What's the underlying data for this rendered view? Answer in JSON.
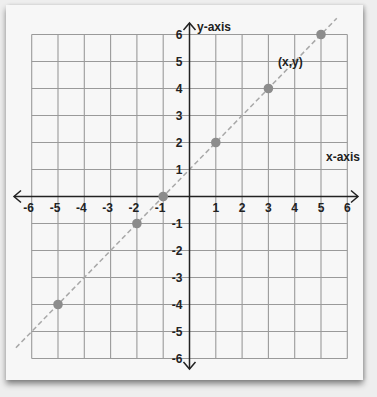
{
  "chart_data": {
    "type": "scatter",
    "title": "",
    "xlabel": "x-axis",
    "ylabel": "y-axis",
    "xlim": [
      -6,
      6
    ],
    "ylim": [
      -6,
      6
    ],
    "grid": true,
    "x_ticks": [
      -6,
      -5,
      -4,
      -3,
      -2,
      -1,
      1,
      2,
      3,
      4,
      5,
      6
    ],
    "y_ticks": [
      6,
      5,
      4,
      3,
      2,
      1,
      -1,
      -2,
      -3,
      -4,
      -5,
      -6
    ],
    "series": [
      {
        "name": "points",
        "points": [
          {
            "x": -5,
            "y": -4
          },
          {
            "x": -2,
            "y": -1
          },
          {
            "x": -1,
            "y": 0
          },
          {
            "x": 1,
            "y": 2
          },
          {
            "x": 3,
            "y": 4
          },
          {
            "x": 5,
            "y": 6
          }
        ]
      }
    ],
    "line": {
      "style": "dashed",
      "equation": "y = x + 1",
      "from": {
        "x": -6.6,
        "y": -5.6
      },
      "to": {
        "x": 5.6,
        "y": 6.6
      }
    },
    "annotations": [
      {
        "text": "(x,y)",
        "x": 3.9,
        "y": 5
      }
    ]
  },
  "colors": {
    "grid": "#9a9a9a",
    "axis": "#222222",
    "point": "#8c8c8c",
    "line": "#a8a8a8",
    "paper": "#f7f7f7",
    "background": "#eeeeee"
  }
}
